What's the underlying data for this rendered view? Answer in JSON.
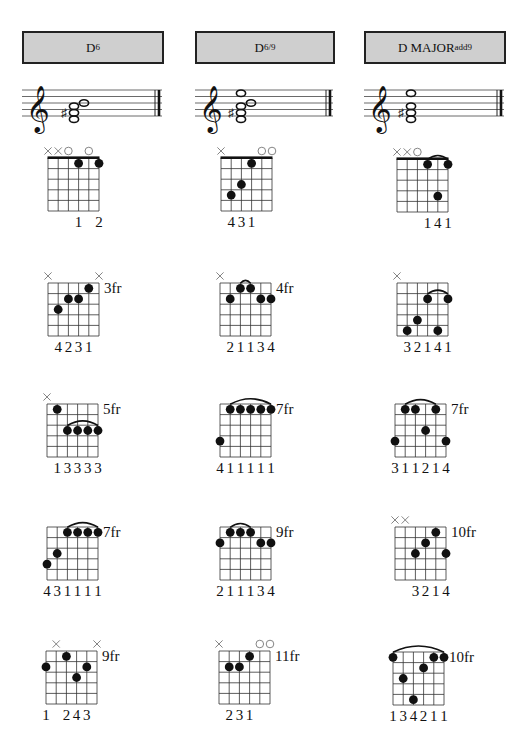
{
  "columns": [
    {
      "title_main": "D",
      "title_sup": "6",
      "header_left": 22,
      "header_width": 142,
      "staff_left": 22,
      "staff_width": 142,
      "staff_notes": [
        {
          "pos": 0,
          "x": 52,
          "sharp": false
        },
        {
          "pos": 1,
          "x": 52,
          "sharp": true
        },
        {
          "pos": 2,
          "x": 52,
          "sharp": false
        },
        {
          "pos": 3,
          "x": 62,
          "sharp": false
        }
      ]
    },
    {
      "title_main": "D",
      "title_sup": "6/9",
      "header_left": 195,
      "header_width": 140,
      "staff_left": 195,
      "staff_width": 140,
      "staff_notes": [
        {
          "pos": 0,
          "x": 46,
          "sharp": false
        },
        {
          "pos": 1,
          "x": 46,
          "sharp": true
        },
        {
          "pos": 2,
          "x": 46,
          "sharp": false
        },
        {
          "pos": 3,
          "x": 56,
          "sharp": false
        },
        {
          "pos": 4,
          "x": 46,
          "sharp": false
        }
      ]
    },
    {
      "title_main": "D MAJOR",
      "title_sup": "add9",
      "header_left": 364,
      "header_width": 142,
      "staff_left": 364,
      "staff_width": 142,
      "staff_notes": [
        {
          "pos": 0,
          "x": 47,
          "sharp": false
        },
        {
          "pos": 1,
          "x": 47,
          "sharp": true
        },
        {
          "pos": 2,
          "x": 47,
          "sharp": false
        },
        {
          "pos": 4,
          "x": 47,
          "sharp": false
        }
      ]
    }
  ],
  "diagrams": [
    {
      "col": 0,
      "row": 0,
      "x": 48,
      "y": 158,
      "nut": true,
      "fret_label": "",
      "markers": [
        "x",
        "x",
        "o",
        "",
        "o",
        ""
      ],
      "dots": [
        {
          "s": 3,
          "f": 1
        },
        {
          "s": 5,
          "f": 1
        }
      ],
      "barres": [],
      "fingering": "  1 2",
      "finger_x": [
        null,
        null,
        null,
        3,
        null,
        5
      ],
      "fingers": [
        "",
        "",
        "",
        "1",
        "",
        "2"
      ]
    },
    {
      "col": 1,
      "row": 0,
      "x": 221,
      "y": 158,
      "nut": true,
      "fret_label": "",
      "markers": [
        "x",
        "",
        "",
        "",
        "o",
        "o"
      ],
      "dots": [
        {
          "s": 1,
          "f": 4
        },
        {
          "s": 2,
          "f": 3
        },
        {
          "s": 3,
          "f": 1
        }
      ],
      "barres": [],
      "fingers": [
        "",
        "4",
        "3",
        "1",
        "",
        ""
      ]
    },
    {
      "col": 2,
      "row": 0,
      "x": 397,
      "y": 159,
      "nut": true,
      "fret_label": "",
      "markers": [
        "x",
        "x",
        "o",
        "",
        "",
        ""
      ],
      "dots": [
        {
          "s": 3,
          "f": 1
        },
        {
          "s": 5,
          "f": 1
        },
        {
          "s": 4,
          "f": 4
        }
      ],
      "barres": [
        {
          "from": 3,
          "to": 5,
          "f": 1
        }
      ],
      "fingers": [
        "",
        "",
        "",
        "1",
        "4",
        "1"
      ]
    },
    {
      "col": 0,
      "row": 1,
      "x": 48,
      "y": 283,
      "nut": false,
      "fret_label": "3fr",
      "markers": [
        "x",
        "",
        "",
        "",
        "",
        "x"
      ],
      "dots": [
        {
          "s": 1,
          "f": 3
        },
        {
          "s": 2,
          "f": 2
        },
        {
          "s": 3,
          "f": 2
        },
        {
          "s": 4,
          "f": 1
        }
      ],
      "barres": [],
      "fingers": [
        "",
        "4",
        "2",
        "3",
        "1",
        ""
      ]
    },
    {
      "col": 1,
      "row": 1,
      "x": 220,
      "y": 283,
      "nut": false,
      "fret_label": "4fr",
      "markers": [
        "x",
        "",
        "",
        "",
        "",
        ""
      ],
      "dots": [
        {
          "s": 1,
          "f": 2
        },
        {
          "s": 2,
          "f": 1
        },
        {
          "s": 3,
          "f": 1
        },
        {
          "s": 4,
          "f": 2
        },
        {
          "s": 5,
          "f": 2
        }
      ],
      "barres": [
        {
          "from": 2,
          "to": 3,
          "f": 1
        }
      ],
      "fingers": [
        "",
        "2",
        "1",
        "1",
        "3",
        "4"
      ]
    },
    {
      "col": 2,
      "row": 1,
      "x": 397,
      "y": 283,
      "nut": false,
      "fret_label": "",
      "markers": [
        "x",
        "",
        "",
        "",
        "",
        ""
      ],
      "dots": [
        {
          "s": 1,
          "f": 5
        },
        {
          "s": 2,
          "f": 4
        },
        {
          "s": 3,
          "f": 2
        },
        {
          "s": 4,
          "f": 5
        },
        {
          "s": 5,
          "f": 2
        }
      ],
      "barres": [
        {
          "from": 3,
          "to": 5,
          "f": 2
        }
      ],
      "fingers": [
        "",
        "3",
        "2",
        "1",
        "4",
        "1"
      ]
    },
    {
      "col": 0,
      "row": 2,
      "x": 47,
      "y": 404,
      "nut": false,
      "fret_label": "5fr",
      "markers": [
        "x",
        "",
        "",
        "",
        "",
        ""
      ],
      "dots": [
        {
          "s": 1,
          "f": 1
        },
        {
          "s": 2,
          "f": 3
        },
        {
          "s": 3,
          "f": 3
        },
        {
          "s": 4,
          "f": 3
        },
        {
          "s": 5,
          "f": 3
        }
      ],
      "barres": [
        {
          "from": 2,
          "to": 5,
          "f": 3
        }
      ],
      "fingers": [
        "",
        "1",
        "3",
        "3",
        "3",
        "3"
      ]
    },
    {
      "col": 1,
      "row": 2,
      "x": 220,
      "y": 404,
      "nut": false,
      "fret_label": "7fr",
      "markers": [
        "",
        "",
        "",
        "",
        "",
        ""
      ],
      "dots": [
        {
          "s": 0,
          "f": 4
        },
        {
          "s": 1,
          "f": 1
        },
        {
          "s": 2,
          "f": 1
        },
        {
          "s": 3,
          "f": 1
        },
        {
          "s": 4,
          "f": 1
        },
        {
          "s": 5,
          "f": 1
        }
      ],
      "barres": [
        {
          "from": 1,
          "to": 5,
          "f": 1
        }
      ],
      "fingers": [
        "4",
        "1",
        "1",
        "1",
        "1",
        "1"
      ]
    },
    {
      "col": 2,
      "row": 2,
      "x": 395,
      "y": 404,
      "nut": false,
      "fret_label": "7fr",
      "markers": [
        "",
        "",
        "",
        "",
        "",
        ""
      ],
      "dots": [
        {
          "s": 0,
          "f": 4
        },
        {
          "s": 1,
          "f": 1
        },
        {
          "s": 2,
          "f": 1
        },
        {
          "s": 3,
          "f": 3
        },
        {
          "s": 4,
          "f": 1
        },
        {
          "s": 5,
          "f": 4
        }
      ],
      "barres": [
        {
          "from": 1,
          "to": 4,
          "f": 1
        }
      ],
      "fingers": [
        "3",
        "1",
        "1",
        "2",
        "1",
        "4"
      ]
    },
    {
      "col": 0,
      "row": 3,
      "x": 47,
      "y": 527,
      "nut": false,
      "fret_label": "7fr",
      "markers": [
        "",
        "",
        "",
        "",
        "",
        ""
      ],
      "dots": [
        {
          "s": 0,
          "f": 4
        },
        {
          "s": 1,
          "f": 3
        },
        {
          "s": 2,
          "f": 1
        },
        {
          "s": 3,
          "f": 1
        },
        {
          "s": 4,
          "f": 1
        },
        {
          "s": 5,
          "f": 1
        }
      ],
      "barres": [
        {
          "from": 2,
          "to": 5,
          "f": 1
        }
      ],
      "fingers": [
        "4",
        "3",
        "1",
        "1",
        "1",
        "1"
      ]
    },
    {
      "col": 1,
      "row": 3,
      "x": 220,
      "y": 527,
      "nut": false,
      "fret_label": "9fr",
      "markers": [
        "",
        "",
        "",
        "",
        "",
        ""
      ],
      "dots": [
        {
          "s": 0,
          "f": 2
        },
        {
          "s": 1,
          "f": 1
        },
        {
          "s": 2,
          "f": 1
        },
        {
          "s": 3,
          "f": 1
        },
        {
          "s": 4,
          "f": 2
        },
        {
          "s": 5,
          "f": 2
        }
      ],
      "barres": [
        {
          "from": 1,
          "to": 3,
          "f": 1
        }
      ],
      "fingers": [
        "2",
        "1",
        "1",
        "1",
        "3",
        "4"
      ]
    },
    {
      "col": 2,
      "row": 3,
      "x": 395,
      "y": 527,
      "nut": false,
      "fret_label": "10fr",
      "markers": [
        "x",
        "x",
        "",
        "",
        "",
        ""
      ],
      "dots": [
        {
          "s": 2,
          "f": 3
        },
        {
          "s": 3,
          "f": 2
        },
        {
          "s": 4,
          "f": 1
        },
        {
          "s": 5,
          "f": 3
        }
      ],
      "barres": [],
      "fingers": [
        "",
        "",
        "3",
        "2",
        "1",
        "4"
      ]
    },
    {
      "col": 0,
      "row": 4,
      "x": 46,
      "y": 651,
      "nut": false,
      "fret_label": "9fr",
      "markers": [
        "",
        "x",
        "",
        "",
        "",
        "x"
      ],
      "dots": [
        {
          "s": 0,
          "f": 2
        },
        {
          "s": 2,
          "f": 1
        },
        {
          "s": 3,
          "f": 3
        },
        {
          "s": 4,
          "f": 2
        }
      ],
      "barres": [],
      "fingers": [
        "1",
        "",
        "2",
        "4",
        "3",
        ""
      ]
    },
    {
      "col": 1,
      "row": 4,
      "x": 219,
      "y": 651,
      "nut": false,
      "fret_label": "11fr",
      "markers": [
        "x",
        "",
        "",
        "",
        "o",
        "o"
      ],
      "dots": [
        {
          "s": 1,
          "f": 2
        },
        {
          "s": 2,
          "f": 2
        },
        {
          "s": 3,
          "f": 1
        }
      ],
      "barres": [],
      "fingers": [
        "",
        "2",
        "3",
        "1",
        "",
        ""
      ]
    },
    {
      "col": 2,
      "row": 4,
      "x": 393,
      "y": 652,
      "nut": false,
      "fret_label": "10fr",
      "markers": [
        "",
        "",
        "",
        "",
        "",
        ""
      ],
      "dots": [
        {
          "s": 0,
          "f": 1
        },
        {
          "s": 1,
          "f": 3
        },
        {
          "s": 2,
          "f": 5
        },
        {
          "s": 3,
          "f": 2
        },
        {
          "s": 4,
          "f": 1
        },
        {
          "s": 5,
          "f": 1
        }
      ],
      "barres": [
        {
          "from": 0,
          "to": 5,
          "f": 1
        }
      ],
      "fingers": [
        "1",
        "3",
        "4",
        "2",
        "1",
        "1"
      ]
    }
  ],
  "fingering_labels": {
    "d0": "1 2",
    "d1": "431",
    "d2": "141",
    "d3": "4231",
    "d4": "21134",
    "d5": "32141",
    "d6": "13333",
    "d7": "411111",
    "d8": "311214",
    "d9": "431111",
    "d10": "211134",
    "d11": "3214",
    "d12": "1 243",
    "d13": "231",
    "d14": "134211"
  },
  "colors": {
    "header_bg": "#cfcfcf",
    "ink": "#111111",
    "grid": "#333333",
    "marker": "#777777"
  }
}
